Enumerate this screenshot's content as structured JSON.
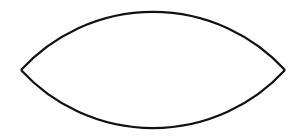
{
  "diagram": {
    "shape": "vesica-lens",
    "background": "#ffffff",
    "stroke_color": "#111111",
    "stroke_width": 2.2,
    "left_tip": {
      "x": 21,
      "y": 70
    },
    "right_tip": {
      "x": 285,
      "y": 70
    },
    "top_apex_y": 12,
    "bottom_apex_y": 129,
    "arc_radius": 179
  }
}
